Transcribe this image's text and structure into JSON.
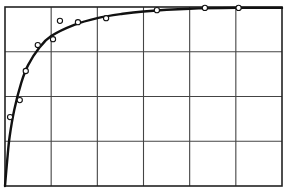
{
  "chart_data": {
    "type": "scatter",
    "title": "",
    "xlabel": "",
    "ylabel": "",
    "xlim": [
      0,
      6
    ],
    "ylim": [
      0,
      4
    ],
    "grid": true,
    "grid_x_divisions": 6,
    "grid_y_divisions": 4,
    "x_tick_labels": [],
    "y_tick_labels": [],
    "legend": [],
    "series": [
      {
        "name": "observed",
        "style": "open-circle",
        "points": [
          {
            "x": 0.11,
            "y": 1.54
          },
          {
            "x": 0.32,
            "y": 1.92
          },
          {
            "x": 0.45,
            "y": 2.57
          },
          {
            "x": 0.71,
            "y": 3.15
          },
          {
            "x": 1.04,
            "y": 3.28
          },
          {
            "x": 1.19,
            "y": 3.69
          },
          {
            "x": 1.58,
            "y": 3.66
          },
          {
            "x": 2.19,
            "y": 3.75
          },
          {
            "x": 3.29,
            "y": 3.93
          },
          {
            "x": 4.33,
            "y": 3.98
          },
          {
            "x": 5.06,
            "y": 3.98
          }
        ]
      },
      {
        "name": "fitted curve",
        "style": "line",
        "points": [
          {
            "x": 0.0,
            "y": 0.0
          },
          {
            "x": 0.05,
            "y": 0.6
          },
          {
            "x": 0.1,
            "y": 1.1
          },
          {
            "x": 0.2,
            "y": 1.7
          },
          {
            "x": 0.35,
            "y": 2.3
          },
          {
            "x": 0.5,
            "y": 2.7
          },
          {
            "x": 0.75,
            "y": 3.1
          },
          {
            "x": 1.0,
            "y": 3.35
          },
          {
            "x": 1.5,
            "y": 3.6
          },
          {
            "x": 2.0,
            "y": 3.75
          },
          {
            "x": 2.5,
            "y": 3.84
          },
          {
            "x": 3.0,
            "y": 3.9
          },
          {
            "x": 4.0,
            "y": 3.96
          },
          {
            "x": 5.0,
            "y": 3.98
          },
          {
            "x": 6.0,
            "y": 3.98
          }
        ]
      }
    ]
  },
  "colors": {
    "line": "#111111",
    "grid": "#444444",
    "background": "#ffffff"
  }
}
